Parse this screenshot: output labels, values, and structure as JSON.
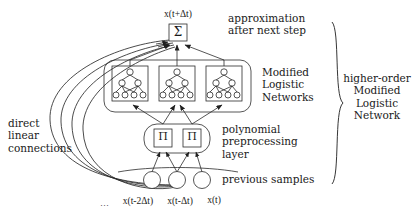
{
  "figure": {
    "type": "neural-network-architecture-diagram",
    "background_color": "#ffffff",
    "line_color": "#2b2b2b",
    "text_color": "#1a1a1a"
  },
  "nodes": {
    "output_unit": {
      "symbol": "Σ",
      "kind": "summation-box",
      "label_above": "x(t+Δt)"
    },
    "product_units": [
      {
        "symbol": "Π",
        "kind": "product-box"
      },
      {
        "symbol": "Π",
        "kind": "product-box"
      }
    ],
    "subnetworks": [
      {
        "name": "modified-logistic-network-1"
      },
      {
        "name": "modified-logistic-network-2"
      },
      {
        "name": "modified-logistic-network-3"
      }
    ],
    "input_units": [
      {
        "label": "x(t-2Δt)"
      },
      {
        "label": "x(t-Δt)"
      },
      {
        "label": "x(t)"
      }
    ],
    "input_ellipsis": "…"
  },
  "annotations": {
    "output_label": "x(t+Δt)",
    "approximation": "approximation\nafter next step",
    "modified_logistic_networks": "Modified\nLogistic\nNetworks",
    "polynomial_layer": "polynomial\npreprocessing\nlayer",
    "previous_samples": "previous samples",
    "direct_linear_connections": "direct\nlinear\nconnections",
    "higher_order": "higher-order\nModified\nLogistic\nNetwork"
  },
  "input_axis_labels": {
    "ellipsis": "…",
    "items": [
      "x(t-2Δt)",
      "x(t-Δt)",
      "x(t)"
    ]
  }
}
